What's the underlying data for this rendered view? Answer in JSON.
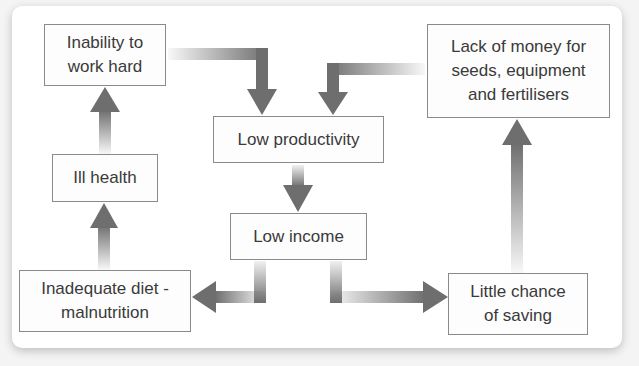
{
  "diagram": {
    "title": "",
    "nodes": [
      {
        "id": "inability",
        "label": "Inability to\nwork hard"
      },
      {
        "id": "low_productivity",
        "label": "Low productivity"
      },
      {
        "id": "lack_money",
        "label": "Lack of money for\nseeds, equipment\nand fertilisers"
      },
      {
        "id": "ill_health",
        "label": "Ill health"
      },
      {
        "id": "low_income",
        "label": "Low income"
      },
      {
        "id": "inadequate_diet",
        "label": "Inadequate diet -\nmalnutrition"
      },
      {
        "id": "little_saving",
        "label": "Little chance\nof saving"
      }
    ],
    "edges": [
      {
        "from": "inability",
        "to": "low_productivity"
      },
      {
        "from": "lack_money",
        "to": "low_productivity"
      },
      {
        "from": "low_productivity",
        "to": "low_income"
      },
      {
        "from": "low_income",
        "to": "inadequate_diet"
      },
      {
        "from": "low_income",
        "to": "little_saving"
      },
      {
        "from": "inadequate_diet",
        "to": "ill_health"
      },
      {
        "from": "ill_health",
        "to": "inability"
      },
      {
        "from": "little_saving",
        "to": "lack_money"
      }
    ],
    "colors": {
      "arrow": "#6e6e6e",
      "border": "#8a8a8a",
      "text": "#3a3a3a"
    }
  }
}
